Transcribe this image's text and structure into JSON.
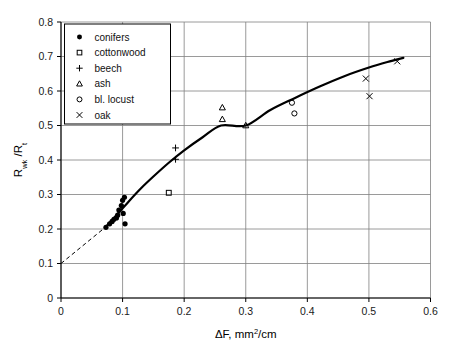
{
  "chart_data": {
    "type": "scatter",
    "title": "",
    "xlabel": "ΔF, mm2/cm",
    "xlabel_base": "ΔF, mm",
    "xlabel_exp": "2",
    "xlabel_tail": "/cm",
    "ylabel": "Rwk /Rt",
    "ylabel_r1": "R",
    "ylabel_sub1": "wk",
    "ylabel_slash": " /R",
    "ylabel_sub2": "t",
    "xlim": [
      0,
      0.6
    ],
    "ylim": [
      0,
      0.8
    ],
    "xticks": [
      "0",
      "0.1",
      "0.2",
      "0.3",
      "0.4",
      "0.5",
      "0.6"
    ],
    "xtick_values": [
      0,
      0.1,
      0.2,
      0.3,
      0.4,
      0.5,
      0.6
    ],
    "yticks": [
      "0",
      "0.1",
      "0.2",
      "0.3",
      "0.4",
      "0.5",
      "0.6",
      "0.7",
      "0.8"
    ],
    "ytick_values": [
      0,
      0.1,
      0.2,
      0.3,
      0.4,
      0.5,
      0.6,
      0.7,
      0.8
    ],
    "grid": true,
    "grid_color": "#808080",
    "legend_position": "top-left",
    "series": [
      {
        "name": "conifers",
        "marker": "filled-circle",
        "color": "#000000",
        "points": [
          [
            0.073,
            0.205
          ],
          [
            0.079,
            0.215
          ],
          [
            0.083,
            0.222
          ],
          [
            0.086,
            0.228
          ],
          [
            0.09,
            0.232
          ],
          [
            0.092,
            0.24
          ],
          [
            0.094,
            0.255
          ],
          [
            0.098,
            0.268
          ],
          [
            0.1,
            0.283
          ],
          [
            0.103,
            0.292
          ],
          [
            0.101,
            0.245
          ],
          [
            0.104,
            0.215
          ]
        ]
      },
      {
        "name": "cottonwood",
        "marker": "open-square",
        "color": "#000000",
        "points": [
          [
            0.175,
            0.305
          ]
        ]
      },
      {
        "name": "beech",
        "marker": "plus",
        "color": "#000000",
        "points": [
          [
            0.186,
            0.435
          ],
          [
            0.186,
            0.402
          ]
        ]
      },
      {
        "name": "ash",
        "marker": "open-triangle",
        "color": "#000000",
        "points": [
          [
            0.262,
            0.552
          ],
          [
            0.262,
            0.518
          ],
          [
            0.3,
            0.5
          ]
        ]
      },
      {
        "name": "bl. locust",
        "marker": "open-circle",
        "color": "#000000",
        "points": [
          [
            0.375,
            0.566
          ],
          [
            0.379,
            0.535
          ]
        ]
      },
      {
        "name": "oak",
        "marker": "cross",
        "color": "#000000",
        "points": [
          [
            0.495,
            0.636
          ],
          [
            0.501,
            0.585
          ],
          [
            0.546,
            0.686
          ]
        ]
      }
    ],
    "fit_curve": {
      "name": "fitted curve",
      "style": "solid",
      "color": "#000000",
      "points": [
        [
          0.072,
          0.205
        ],
        [
          0.09,
          0.24
        ],
        [
          0.11,
          0.28
        ],
        [
          0.13,
          0.318
        ],
        [
          0.15,
          0.352
        ],
        [
          0.175,
          0.392
        ],
        [
          0.2,
          0.428
        ],
        [
          0.23,
          0.466
        ],
        [
          0.26,
          0.5
        ],
        [
          0.3,
          0.5
        ],
        [
          0.34,
          0.545
        ],
        [
          0.38,
          0.58
        ],
        [
          0.42,
          0.613
        ],
        [
          0.46,
          0.643
        ],
        [
          0.5,
          0.668
        ],
        [
          0.53,
          0.684
        ],
        [
          0.556,
          0.696
        ]
      ]
    },
    "extrapolation": {
      "name": "dashed extrapolation",
      "style": "dashed",
      "color": "#000000",
      "points": [
        [
          0.0,
          0.1
        ],
        [
          0.072,
          0.205
        ]
      ]
    },
    "annotations": []
  },
  "legend": {
    "items": [
      {
        "label": "conifers",
        "marker": "filled-circle"
      },
      {
        "label": "cottonwood",
        "marker": "open-square"
      },
      {
        "label": "beech",
        "marker": "plus"
      },
      {
        "label": "ash",
        "marker": "open-triangle"
      },
      {
        "label": "bl. locust",
        "marker": "open-circle"
      },
      {
        "label": "oak",
        "marker": "cross"
      }
    ]
  }
}
